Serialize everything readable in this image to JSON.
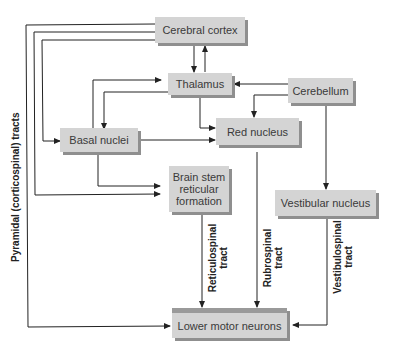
{
  "nodes": {
    "cerebral_cortex": "Cerebral cortex",
    "thalamus": "Thalamus",
    "cerebellum": "Cerebellum",
    "basal_nuclei": "Basal nuclei",
    "red_nucleus": "Red nucleus",
    "brain_stem_1": "Brain stem",
    "brain_stem_2": "reticular",
    "brain_stem_3": "formation",
    "vestibular_nucleus": "Vestibular nucleus",
    "lower_motor_neurons": "Lower motor neurons"
  },
  "tracts": {
    "pyramidal": "Pyramidal (corticospinal) tracts",
    "reticulospinal_1": "Reticulospinal",
    "reticulospinal_2": "tract",
    "rubrospinal_1": "Rubrospinal",
    "rubrospinal_2": "tract",
    "vestibulospinal_1": "Vestibulospinal",
    "vestibulospinal_2": "tract"
  },
  "colors": {
    "box_fill": "#d4d4d4",
    "box_shadow": "#8f8f8f",
    "line": "#222222"
  }
}
